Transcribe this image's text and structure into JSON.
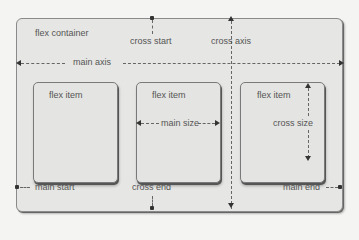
{
  "diagram": {
    "container_label": "flex container",
    "items": [
      {
        "label": "flex item"
      },
      {
        "label": "flex item",
        "annotation": "main size"
      },
      {
        "label": "flex item",
        "annotation": "cross size"
      }
    ],
    "axes": {
      "main_axis": "main axis",
      "cross_axis": "cross axis",
      "cross_start": "cross start",
      "cross_end": "cross end",
      "main_start": "main start",
      "main_end": "main end"
    }
  }
}
